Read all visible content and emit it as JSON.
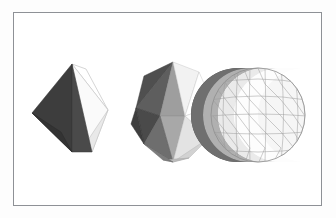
{
  "figure": {
    "background_color": "#ffffff",
    "page_color": "#fdfdfd",
    "frame": {
      "border_color": "#8e9196",
      "x": 13,
      "y": 12,
      "width": 309,
      "height": 194
    },
    "caption": "",
    "shapes": [
      {
        "name": "octahedron",
        "label": "octahedron",
        "subdivision_level": 0,
        "center_x": 70,
        "center_y": 107,
        "radius": 40,
        "face_count": 8
      },
      {
        "name": "subdivided-polyhedron",
        "label": "subdivided polyhedron",
        "subdivision_level": 1,
        "center_x": 160,
        "center_y": 107,
        "radius": 43,
        "face_count": 32
      },
      {
        "name": "geodesic-sphere",
        "label": "geodesic sphere",
        "subdivision_level": 2,
        "center_x": 255,
        "center_y": 107,
        "radius": 47,
        "face_count": 128
      }
    ],
    "shading": {
      "light_direction": "upper-right",
      "edge_color": "#9a9a9a",
      "face_tones": {
        "darkest": "#3a3a3a",
        "dark": "#4a4a4a",
        "mid_dark": "#6d6d6d",
        "mid": "#8e8e8e",
        "mid_light": "#b4b4b4",
        "light": "#d8d8d8",
        "lightest": "#f4f4f4",
        "white": "#ffffff"
      }
    }
  }
}
